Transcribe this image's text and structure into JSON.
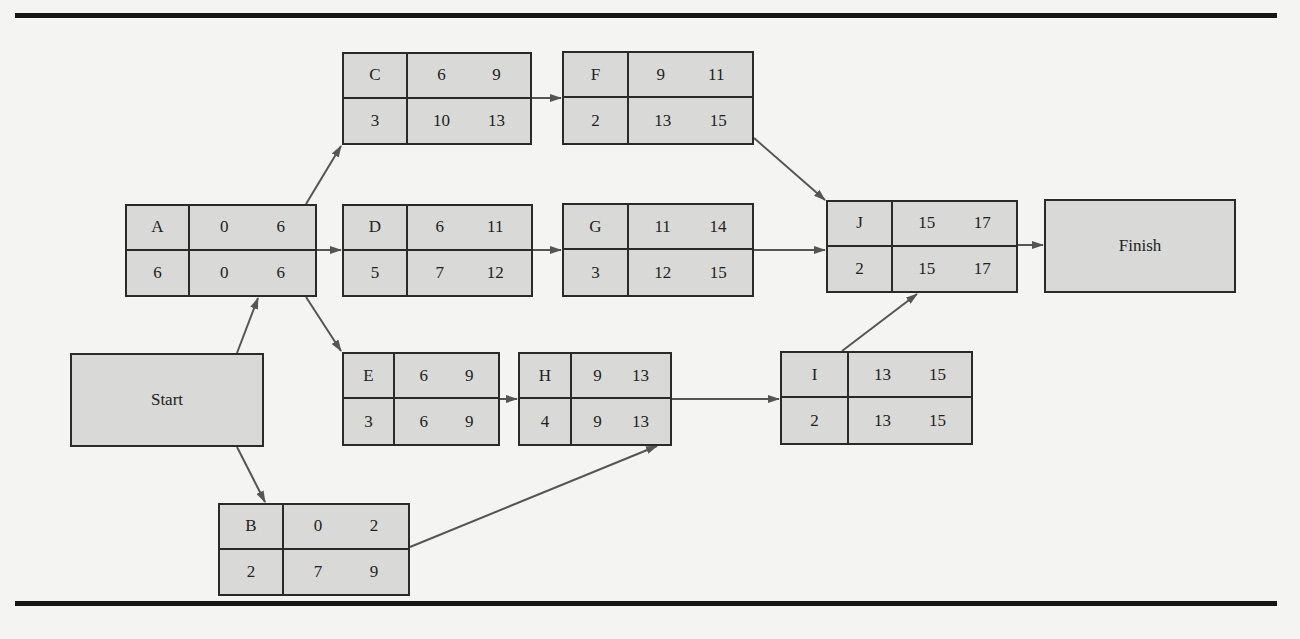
{
  "diagram": {
    "type": "activity-on-node network (critical path)",
    "cell_layout": {
      "top_left": "activity",
      "top_middle": "earliest start",
      "top_right": "earliest finish",
      "bottom_left": "duration",
      "bottom_middle": "latest start",
      "bottom_right": "latest finish"
    },
    "start": {
      "label": "Start"
    },
    "finish": {
      "label": "Finish"
    },
    "nodes": {
      "A": {
        "activity": "A",
        "es": "0",
        "ef": "6",
        "duration": "6",
        "ls": "0",
        "lf": "6"
      },
      "B": {
        "activity": "B",
        "es": "0",
        "ef": "2",
        "duration": "2",
        "ls": "7",
        "lf": "9"
      },
      "C": {
        "activity": "C",
        "es": "6",
        "ef": "9",
        "duration": "3",
        "ls": "10",
        "lf": "13"
      },
      "D": {
        "activity": "D",
        "es": "6",
        "ef": "11",
        "duration": "5",
        "ls": "7",
        "lf": "12"
      },
      "E": {
        "activity": "E",
        "es": "6",
        "ef": "9",
        "duration": "3",
        "ls": "6",
        "lf": "9"
      },
      "F": {
        "activity": "F",
        "es": "9",
        "ef": "11",
        "duration": "2",
        "ls": "13",
        "lf": "15"
      },
      "G": {
        "activity": "G",
        "es": "11",
        "ef": "14",
        "duration": "3",
        "ls": "12",
        "lf": "15"
      },
      "H": {
        "activity": "H",
        "es": "9",
        "ef": "13",
        "duration": "4",
        "ls": "9",
        "lf": "13"
      },
      "I": {
        "activity": "I",
        "es": "13",
        "ef": "15",
        "duration": "2",
        "ls": "13",
        "lf": "15"
      },
      "J": {
        "activity": "J",
        "es": "15",
        "ef": "17",
        "duration": "2",
        "ls": "15",
        "lf": "17"
      }
    },
    "edges": [
      [
        "Start",
        "A"
      ],
      [
        "Start",
        "B"
      ],
      [
        "A",
        "C"
      ],
      [
        "A",
        "D"
      ],
      [
        "A",
        "E"
      ],
      [
        "C",
        "F"
      ],
      [
        "D",
        "G"
      ],
      [
        "E",
        "H"
      ],
      [
        "B",
        "H"
      ],
      [
        "F",
        "J"
      ],
      [
        "G",
        "J"
      ],
      [
        "H",
        "I"
      ],
      [
        "I",
        "J"
      ],
      [
        "J",
        "Finish"
      ]
    ]
  },
  "colors": {
    "background": "#f4f4f2",
    "node_fill": "#d9d9d7",
    "border": "#2a2a2a",
    "arrow": "#555555",
    "rule": "#161616"
  }
}
